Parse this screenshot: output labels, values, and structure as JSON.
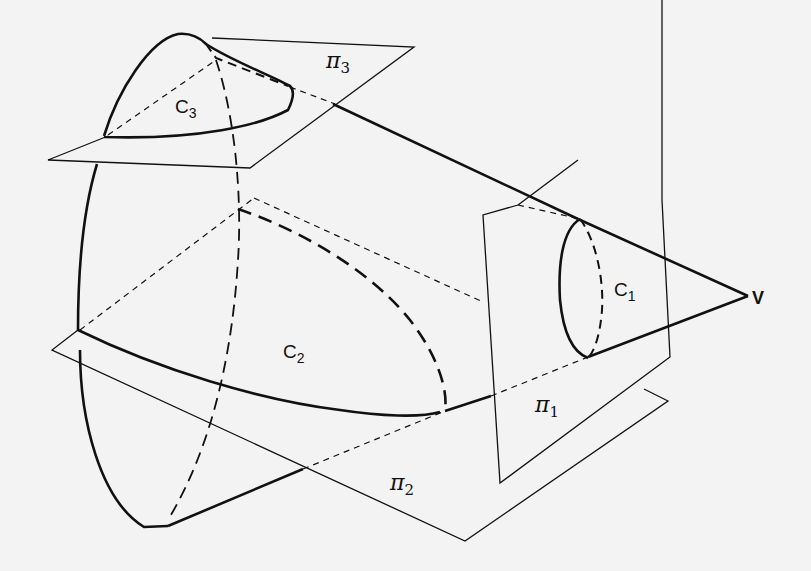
{
  "figure": {
    "background": "#f3f3f3",
    "stroke_color": "#111111"
  },
  "labels": {
    "vertex": "V",
    "c1": {
      "base": "C",
      "sub": "1"
    },
    "c2": {
      "base": "C",
      "sub": "2"
    },
    "c3": {
      "base": "C",
      "sub": "3"
    },
    "pi1": {
      "base": "π",
      "sub": "1"
    },
    "pi2": {
      "base": "π",
      "sub": "2"
    },
    "pi3": {
      "base": "π",
      "sub": "3"
    }
  },
  "elements": {
    "cone": "cone with vertex V opening to the left",
    "plane_pi1": "vertical plane cutting circle C1",
    "plane_pi2": "inclined plane cutting ellipse/parabola C2",
    "plane_pi3": "plane cutting hyperbola-like curve C3"
  }
}
